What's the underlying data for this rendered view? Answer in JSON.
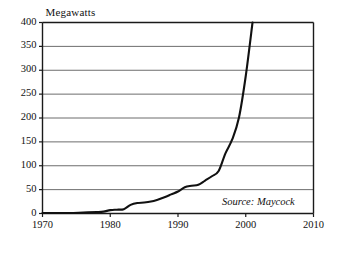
{
  "chart_data": {
    "type": "line",
    "title": "",
    "ylabel": "Megawatts",
    "xlabel": "",
    "xlim": [
      1970,
      2010
    ],
    "ylim": [
      0,
      400
    ],
    "grid": true,
    "legend": null,
    "annotation": "Source: Maycock",
    "y_ticks": [
      0,
      50,
      100,
      150,
      200,
      250,
      300,
      350,
      400
    ],
    "y_tick_labels": [
      "0",
      "50",
      "100",
      "150",
      "200",
      "250",
      "300",
      "350",
      "400"
    ],
    "x_ticks": [
      1970,
      1980,
      1990,
      2000,
      2010
    ],
    "x_tick_labels": [
      "1970",
      "1980",
      "1990",
      "2000",
      "2010"
    ],
    "series": [
      {
        "name": "Megawatts",
        "color": "#111111",
        "x": [
          1970,
          1972,
          1974,
          1976,
          1978,
          1979,
          1980,
          1981,
          1982,
          1983,
          1984,
          1985,
          1986,
          1987,
          1988,
          1989,
          1990,
          1991,
          1992,
          1993,
          1994,
          1995,
          1996,
          1997,
          1998,
          1999,
          2000,
          2001
        ],
        "y": [
          1,
          1,
          1,
          2,
          3,
          4,
          7,
          8,
          9,
          18,
          22,
          23,
          25,
          29,
          34,
          40,
          46,
          55,
          58,
          60,
          69,
          78,
          89,
          126,
          155,
          201,
          288,
          400
        ]
      }
    ]
  },
  "axis_title": "Megawatts",
  "source_note": "Source: Maycock"
}
